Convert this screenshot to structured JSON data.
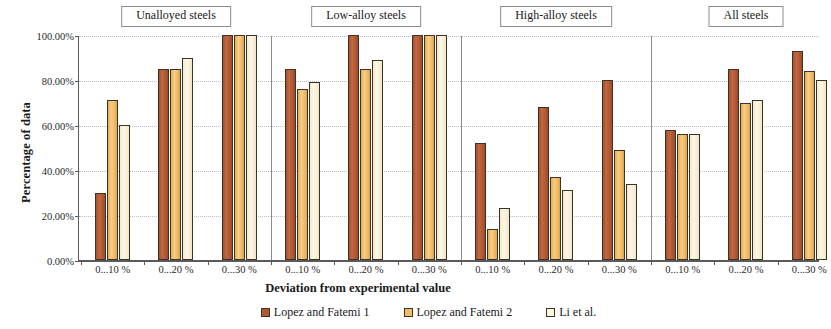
{
  "chart_data": {
    "type": "bar",
    "title": "",
    "xlabel": "Deviation from experimental value",
    "ylabel": "Percentage of data",
    "ylim": [
      0,
      100
    ],
    "ytick_labels": [
      "0.00%",
      "20.00%",
      "40.00%",
      "60.00%",
      "80.00%",
      "100.00%"
    ],
    "ytick_values": [
      0,
      20,
      40,
      60,
      80,
      100
    ],
    "grid": true,
    "legend_position": "bottom",
    "panel_titles": [
      "Unalloyed steels",
      "Low-alloy steels",
      "High-alloy steels",
      "All steels"
    ],
    "categories": [
      "0...10 %",
      "0...20 %",
      "0...30 %"
    ],
    "series_names": [
      "Lopez and Fatemi 1",
      "Lopez and Fatemi 2",
      "Li et al."
    ],
    "series_colors": [
      "#b05a34",
      "#f0bd6a",
      "#fbf6e0"
    ],
    "panels": [
      {
        "title": "Unalloyed steels",
        "categories": [
          "0...10 %",
          "0...20 %",
          "0...30 %"
        ],
        "series": [
          {
            "name": "Lopez and Fatemi 1",
            "values": [
              30,
              85,
              100
            ]
          },
          {
            "name": "Lopez and Fatemi 2",
            "values": [
              71,
              85,
              100
            ]
          },
          {
            "name": "Li et al.",
            "values": [
              60,
              90,
              100
            ]
          }
        ]
      },
      {
        "title": "Low-alloy steels",
        "categories": [
          "0...10 %",
          "0...20 %",
          "0...30 %"
        ],
        "series": [
          {
            "name": "Lopez and Fatemi 1",
            "values": [
              85,
              100,
              100
            ]
          },
          {
            "name": "Lopez and Fatemi 2",
            "values": [
              76,
              85,
              100
            ]
          },
          {
            "name": "Li et al.",
            "values": [
              79,
              89,
              100
            ]
          }
        ]
      },
      {
        "title": "High-alloy steels",
        "categories": [
          "0...10 %",
          "0...20 %",
          "0...30 %"
        ],
        "series": [
          {
            "name": "Lopez and Fatemi 1",
            "values": [
              52,
              68,
              80
            ]
          },
          {
            "name": "Lopez and Fatemi 2",
            "values": [
              14,
              37,
              49
            ]
          },
          {
            "name": "Li et al.",
            "values": [
              23,
              31,
              34
            ]
          }
        ]
      },
      {
        "title": "All steels",
        "categories": [
          "0...10 %",
          "0...20 %",
          "0...30 %"
        ],
        "series": [
          {
            "name": "Lopez and Fatemi 1",
            "values": [
              58,
              85,
              93
            ]
          },
          {
            "name": "Lopez and Fatemi 2",
            "values": [
              56,
              70,
              84
            ]
          },
          {
            "name": "Li et al.",
            "values": [
              56,
              71,
              80
            ]
          }
        ]
      }
    ]
  },
  "axes": {
    "y_title": "Percentage of data",
    "x_title": "Deviation from experimental value"
  },
  "legend": {
    "entries": [
      {
        "label": "Lopez and Fatemi 1",
        "color": "#b05a34"
      },
      {
        "label": "Lopez and Fatemi 2",
        "color": "#f0bd6a"
      },
      {
        "label": "Li et al.",
        "color": "#fbf6e0"
      }
    ]
  }
}
